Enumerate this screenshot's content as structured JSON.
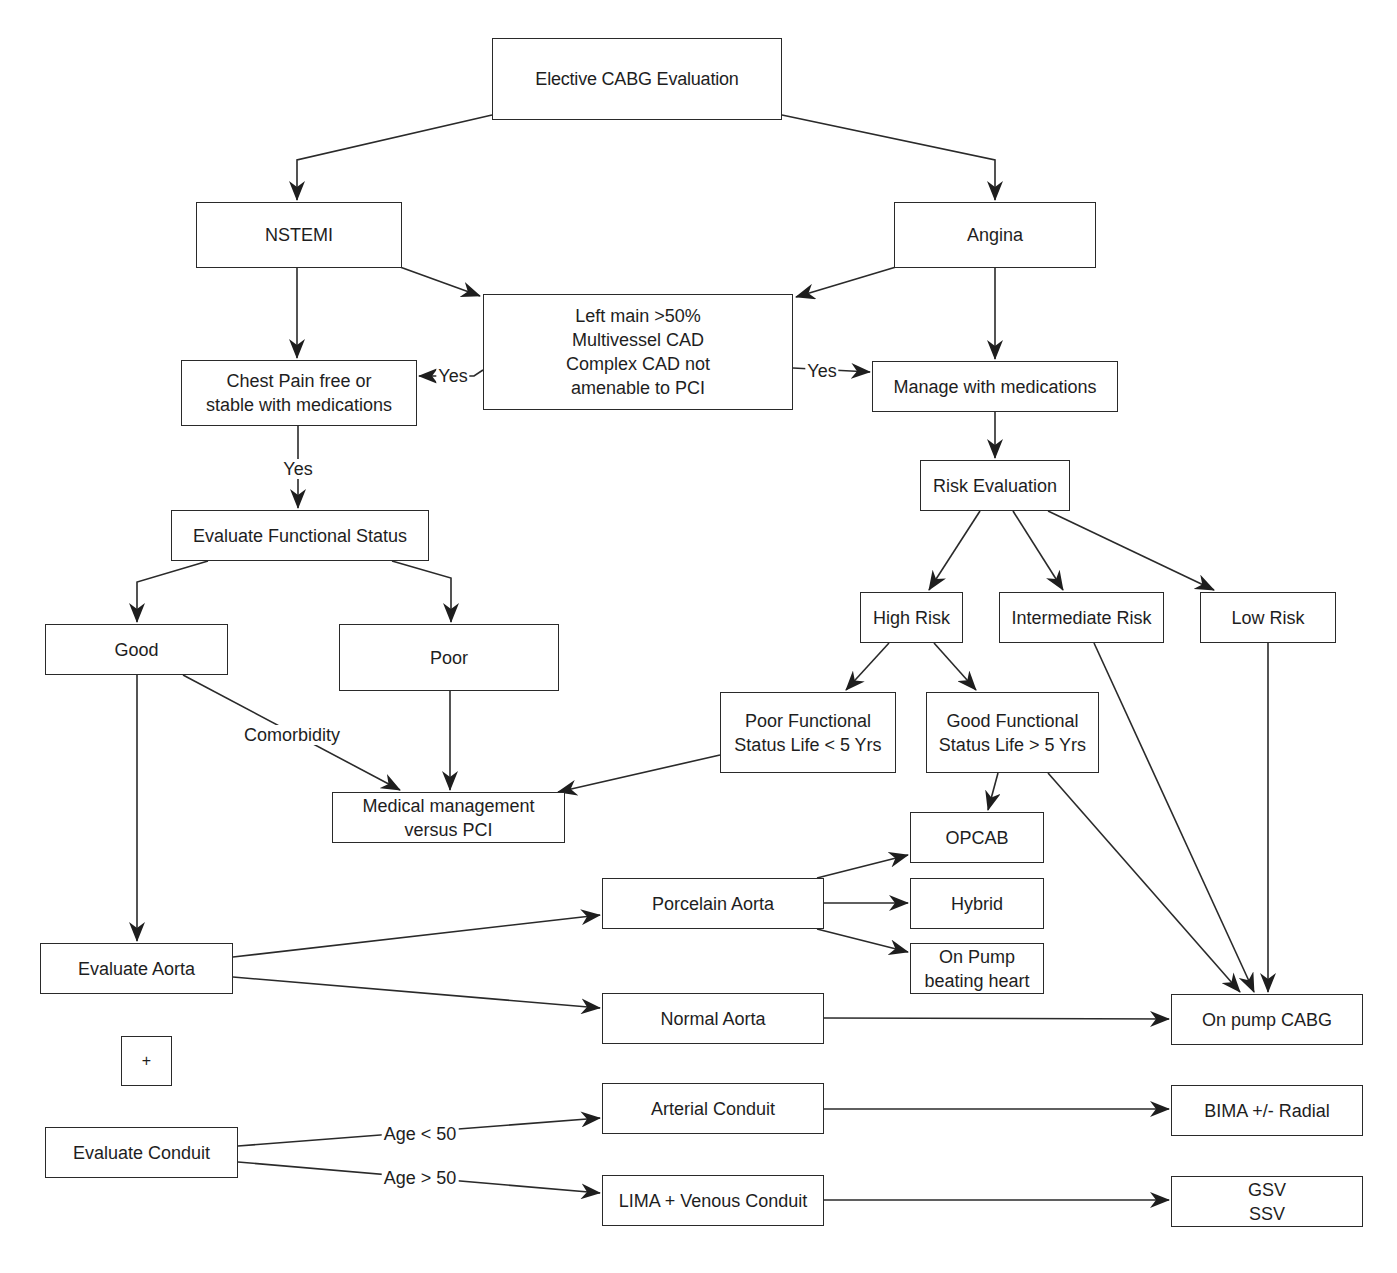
{
  "diagram": {
    "title": "Elective CABG Evaluation",
    "nodes": [
      {
        "id": "root",
        "label": "Elective CABG Evaluation",
        "x": 492,
        "y": 38,
        "w": 290,
        "h": 82,
        "cls": "title"
      },
      {
        "id": "nstemi",
        "label": "NSTEMI",
        "x": 196,
        "y": 202,
        "w": 206,
        "h": 66
      },
      {
        "id": "angina",
        "label": "Angina",
        "x": 894,
        "y": 202,
        "w": 202,
        "h": 66
      },
      {
        "id": "criteria",
        "label": "Left main >50%\nMultivessel CAD\nComplex CAD not\namenable to PCI",
        "x": 483,
        "y": 294,
        "w": 310,
        "h": 116
      },
      {
        "id": "chestpain",
        "label": "Chest Pain free or\nstable with medications",
        "x": 181,
        "y": 360,
        "w": 236,
        "h": 66
      },
      {
        "id": "managemed",
        "label": "Manage with medications",
        "x": 872,
        "y": 361,
        "w": 246,
        "h": 51
      },
      {
        "id": "evalfunc",
        "label": "Evaluate Functional Status",
        "x": 171,
        "y": 510,
        "w": 258,
        "h": 51
      },
      {
        "id": "riskeval",
        "label": "Risk Evaluation",
        "x": 920,
        "y": 460,
        "w": 150,
        "h": 51
      },
      {
        "id": "good",
        "label": "Good",
        "x": 45,
        "y": 624,
        "w": 183,
        "h": 51
      },
      {
        "id": "poor",
        "label": "Poor",
        "x": 339,
        "y": 624,
        "w": 220,
        "h": 67
      },
      {
        "id": "highrisk",
        "label": "High Risk",
        "x": 860,
        "y": 592,
        "w": 103,
        "h": 51
      },
      {
        "id": "interrisk",
        "label": "Intermediate Risk",
        "x": 999,
        "y": 592,
        "w": 165,
        "h": 51
      },
      {
        "id": "lowrisk",
        "label": "Low Risk",
        "x": 1200,
        "y": 592,
        "w": 136,
        "h": 51
      },
      {
        "id": "poorfunc",
        "label": "Poor Functional\nStatus Life < 5 Yrs",
        "x": 720,
        "y": 692,
        "w": 176,
        "h": 81
      },
      {
        "id": "goodfunc",
        "label": "Good Functional\nStatus Life > 5 Yrs",
        "x": 926,
        "y": 692,
        "w": 173,
        "h": 81
      },
      {
        "id": "medmgmt",
        "label": "Medical management\nversus PCI",
        "x": 332,
        "y": 792,
        "w": 233,
        "h": 51
      },
      {
        "id": "opcab",
        "label": "OPCAB",
        "x": 910,
        "y": 812,
        "w": 134,
        "h": 51
      },
      {
        "id": "porcelain",
        "label": "Porcelain Aorta",
        "x": 602,
        "y": 878,
        "w": 222,
        "h": 51
      },
      {
        "id": "hybrid",
        "label": "Hybrid",
        "x": 910,
        "y": 878,
        "w": 134,
        "h": 51
      },
      {
        "id": "evalaorta",
        "label": "Evaluate Aorta",
        "x": 40,
        "y": 943,
        "w": 193,
        "h": 51
      },
      {
        "id": "onpumpbh",
        "label": "On Pump\nbeating heart",
        "x": 910,
        "y": 943,
        "w": 134,
        "h": 51
      },
      {
        "id": "normalaorta",
        "label": "Normal Aorta",
        "x": 602,
        "y": 993,
        "w": 222,
        "h": 51
      },
      {
        "id": "onpumpcabg",
        "label": "On pump CABG",
        "x": 1171,
        "y": 994,
        "w": 192,
        "h": 51
      },
      {
        "id": "plus",
        "label": "+",
        "x": 121,
        "y": 1036,
        "w": 51,
        "h": 50,
        "cls": "plus"
      },
      {
        "id": "arterial",
        "label": "Arterial Conduit",
        "x": 602,
        "y": 1083,
        "w": 222,
        "h": 51
      },
      {
        "id": "bima",
        "label": "BIMA +/- Radial",
        "x": 1171,
        "y": 1085,
        "w": 192,
        "h": 51
      },
      {
        "id": "evalconduit",
        "label": "Evaluate Conduit",
        "x": 45,
        "y": 1127,
        "w": 193,
        "h": 51
      },
      {
        "id": "lima",
        "label": "LIMA + Venous Conduit",
        "x": 602,
        "y": 1175,
        "w": 222,
        "h": 51
      },
      {
        "id": "gsvssv",
        "label": "GSV\nSSV",
        "x": 1171,
        "y": 1176,
        "w": 192,
        "h": 51
      }
    ],
    "edges": [
      {
        "from": "root",
        "to": "nstemi",
        "points": [
          [
            492,
            115
          ],
          [
            297,
            160
          ],
          [
            297,
            200
          ]
        ]
      },
      {
        "from": "root",
        "to": "angina",
        "points": [
          [
            782,
            115
          ],
          [
            995,
            160
          ],
          [
            995,
            200
          ]
        ]
      },
      {
        "from": "nstemi",
        "to": "criteria",
        "points": [
          [
            400,
            267
          ],
          [
            480,
            296
          ]
        ]
      },
      {
        "from": "angina",
        "to": "criteria",
        "points": [
          [
            896,
            267
          ],
          [
            796,
            297
          ]
        ]
      },
      {
        "from": "nstemi",
        "to": "chestpain",
        "points": [
          [
            297,
            268
          ],
          [
            297,
            358
          ]
        ]
      },
      {
        "from": "angina",
        "to": "managemed",
        "points": [
          [
            995,
            268
          ],
          [
            995,
            359
          ]
        ]
      },
      {
        "from": "criteria",
        "to": "chestpain",
        "label": "Yes",
        "labelAt": [
          453,
          376
        ],
        "points": [
          [
            483,
            370
          ],
          [
            474,
            376
          ],
          [
            419,
            376
          ]
        ]
      },
      {
        "from": "criteria",
        "to": "managemed",
        "label": "Yes",
        "labelAt": [
          822,
          371
        ],
        "points": [
          [
            793,
            368
          ],
          [
            870,
            372
          ]
        ]
      },
      {
        "from": "chestpain",
        "to": "evalfunc",
        "label": "Yes",
        "labelAt": [
          298,
          469
        ],
        "points": [
          [
            298,
            426
          ],
          [
            298,
            508
          ]
        ]
      },
      {
        "from": "managemed",
        "to": "riskeval",
        "points": [
          [
            995,
            412
          ],
          [
            995,
            458
          ]
        ]
      },
      {
        "from": "evalfunc",
        "to": "good",
        "points": [
          [
            208,
            561
          ],
          [
            137,
            582
          ],
          [
            137,
            622
          ]
        ]
      },
      {
        "from": "evalfunc",
        "to": "poor",
        "points": [
          [
            392,
            561
          ],
          [
            451,
            578
          ],
          [
            451,
            622
          ]
        ]
      },
      {
        "from": "riskeval",
        "to": "highrisk",
        "points": [
          [
            980,
            511
          ],
          [
            929,
            590
          ]
        ]
      },
      {
        "from": "riskeval",
        "to": "interrisk",
        "points": [
          [
            1013,
            511
          ],
          [
            1063,
            590
          ]
        ]
      },
      {
        "from": "riskeval",
        "to": "lowrisk",
        "points": [
          [
            1048,
            511
          ],
          [
            1214,
            590
          ]
        ]
      },
      {
        "from": "highrisk",
        "to": "poorfunc",
        "points": [
          [
            889,
            643
          ],
          [
            846,
            690
          ]
        ]
      },
      {
        "from": "highrisk",
        "to": "goodfunc",
        "points": [
          [
            934,
            643
          ],
          [
            976,
            690
          ]
        ]
      },
      {
        "from": "good",
        "to": "medmgmt",
        "label": "Comorbidity",
        "labelAt": [
          292,
          735
        ],
        "points": [
          [
            183,
            675
          ],
          [
            400,
            790
          ]
        ]
      },
      {
        "from": "poor",
        "to": "medmgmt",
        "points": [
          [
            450,
            691
          ],
          [
            450,
            790
          ]
        ]
      },
      {
        "from": "poorfunc",
        "to": "medmgmt",
        "points": [
          [
            720,
            755
          ],
          [
            558,
            792
          ]
        ]
      },
      {
        "from": "goodfunc",
        "to": "opcab",
        "points": [
          [
            998,
            773
          ],
          [
            988,
            810
          ]
        ]
      },
      {
        "from": "goodfunc",
        "to": "onpumpcabg",
        "points": [
          [
            1048,
            773
          ],
          [
            1240,
            992
          ]
        ]
      },
      {
        "from": "interrisk",
        "to": "onpumpcabg",
        "points": [
          [
            1094,
            643
          ],
          [
            1254,
            992
          ]
        ]
      },
      {
        "from": "lowrisk",
        "to": "onpumpcabg",
        "points": [
          [
            1268,
            643
          ],
          [
            1268,
            992
          ]
        ]
      },
      {
        "from": "good",
        "to": "evalaorta",
        "points": [
          [
            137,
            675
          ],
          [
            137,
            941
          ]
        ]
      },
      {
        "from": "evalaorta",
        "to": "porcelain",
        "points": [
          [
            233,
            957
          ],
          [
            600,
            915
          ]
        ]
      },
      {
        "from": "evalaorta",
        "to": "normalaorta",
        "points": [
          [
            233,
            977
          ],
          [
            600,
            1008
          ]
        ]
      },
      {
        "from": "porcelain",
        "to": "opcab",
        "points": [
          [
            817,
            878
          ],
          [
            908,
            855
          ]
        ]
      },
      {
        "from": "porcelain",
        "to": "hybrid",
        "points": [
          [
            824,
            903
          ],
          [
            908,
            903
          ]
        ]
      },
      {
        "from": "porcelain",
        "to": "onpumpbh",
        "points": [
          [
            817,
            929
          ],
          [
            908,
            952
          ]
        ]
      },
      {
        "from": "normalaorta",
        "to": "onpumpcabg",
        "points": [
          [
            824,
            1018
          ],
          [
            1169,
            1019
          ]
        ]
      },
      {
        "from": "evalconduit",
        "to": "arterial",
        "label": "Age < 50",
        "labelAt": [
          420,
          1134
        ],
        "points": [
          [
            238,
            1146
          ],
          [
            600,
            1118
          ]
        ]
      },
      {
        "from": "evalconduit",
        "to": "lima",
        "label": "Age > 50",
        "labelAt": [
          420,
          1178
        ],
        "points": [
          [
            238,
            1162
          ],
          [
            600,
            1193
          ]
        ]
      },
      {
        "from": "arterial",
        "to": "bima",
        "points": [
          [
            824,
            1109
          ],
          [
            1169,
            1109
          ]
        ]
      },
      {
        "from": "lima",
        "to": "gsvssv",
        "points": [
          [
            824,
            1200
          ],
          [
            1169,
            1200
          ]
        ]
      }
    ]
  },
  "colors": {
    "line": "#2a2a2a",
    "border": "#2a2a2a",
    "text": "#1e1e1e",
    "background": "#ffffff"
  }
}
